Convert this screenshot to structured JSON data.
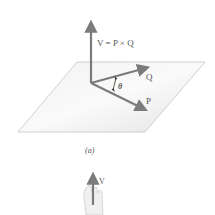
{
  "figure": {
    "vector_v_label": "V = P × Q",
    "vector_q_label": "Q",
    "vector_p_label": "P",
    "angle_label": "θ",
    "caption": "(a)",
    "hand_vector_label": "V"
  },
  "colors": {
    "arrow": "#7b7b7b",
    "plane_fill": "#ececec",
    "plane_edge": "#bdbdbd",
    "text": "#555555"
  }
}
